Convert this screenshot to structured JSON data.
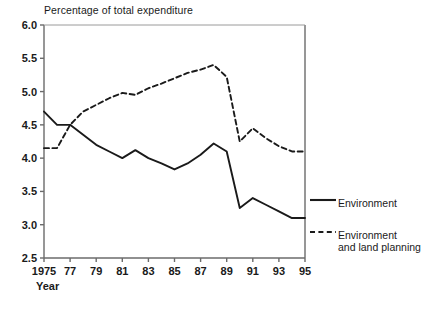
{
  "chart_data": {
    "type": "line",
    "title": "Percentage of total expenditure",
    "xlabel": "Year",
    "ylabel": "",
    "xlim": [
      1975,
      1995
    ],
    "ylim": [
      2.5,
      6.0
    ],
    "yticks": [
      "2.5",
      "3.0",
      "3.5",
      "4.0",
      "4.5",
      "5.0",
      "5.5",
      "6.0"
    ],
    "xticks": [
      "1975",
      "77",
      "79",
      "81",
      "83",
      "85",
      "87",
      "89",
      "91",
      "93",
      "95"
    ],
    "xtick_values": [
      1975,
      1977,
      1979,
      1981,
      1983,
      1985,
      1987,
      1989,
      1991,
      1993,
      1995
    ],
    "grid": false,
    "legend_position": "right-outside",
    "x": [
      1975,
      1976,
      1977,
      1978,
      1979,
      1980,
      1981,
      1982,
      1983,
      1984,
      1985,
      1986,
      1987,
      1988,
      1989,
      1990,
      1991,
      1992,
      1993,
      1994,
      1995
    ],
    "series": [
      {
        "name": "Environment",
        "style": "solid",
        "color": "#1a1a1a",
        "values": [
          4.7,
          4.5,
          4.5,
          4.35,
          4.2,
          4.1,
          4.0,
          4.12,
          4.0,
          3.92,
          3.83,
          3.92,
          4.05,
          4.22,
          4.1,
          3.25,
          3.4,
          3.3,
          3.2,
          3.1,
          3.1
        ]
      },
      {
        "name": "Environment and land planning",
        "style": "dashed",
        "color": "#1a1a1a",
        "values": [
          4.15,
          4.15,
          4.5,
          4.7,
          4.8,
          4.9,
          4.98,
          4.95,
          5.05,
          5.12,
          5.2,
          5.28,
          5.33,
          5.4,
          5.22,
          4.25,
          4.45,
          4.3,
          4.18,
          4.1,
          4.1
        ]
      }
    ]
  },
  "legend": {
    "entries": [
      {
        "label": "Environment",
        "style": "solid"
      },
      {
        "label": "Environment\nand land planning",
        "style": "dashed"
      }
    ]
  }
}
